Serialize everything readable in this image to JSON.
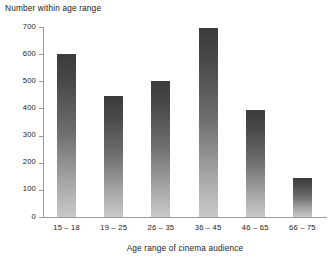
{
  "chart_data": {
    "type": "bar",
    "title": "Number within age range",
    "xlabel": "Age range of cinema audience",
    "ylabel": "",
    "categories": [
      "15 – 18",
      "19 – 25",
      "26 – 35",
      "36 – 45",
      "46 – 65",
      "66 – 75"
    ],
    "values": [
      600,
      445,
      500,
      695,
      395,
      143
    ],
    "ylim": [
      0,
      700
    ],
    "yticks": [
      0,
      100,
      200,
      300,
      400,
      500,
      600,
      700
    ],
    "ytick_labels": [
      "0",
      "100",
      "200",
      "300",
      "400",
      "500",
      "600",
      "700"
    ],
    "grid": false,
    "legend": null,
    "bar_color_top": "#3b3b3b",
    "bar_color_bottom": "#c9c9c9",
    "axis_color": "#9a9a9a",
    "background": "#ffffff"
  }
}
